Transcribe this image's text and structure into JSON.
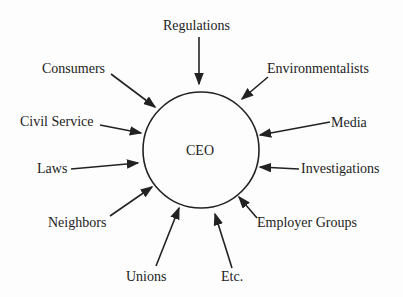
{
  "diagram": {
    "center": {
      "label": "CEO"
    },
    "influences": [
      {
        "label": "Regulations"
      },
      {
        "label": "Environmentalists"
      },
      {
        "label": "Media"
      },
      {
        "label": "Investigations"
      },
      {
        "label": "Employer Groups"
      },
      {
        "label": "Etc."
      },
      {
        "label": "Unions"
      },
      {
        "label": "Neighbors"
      },
      {
        "label": "Laws"
      },
      {
        "label": "Civil Service"
      },
      {
        "label": "Consumers"
      }
    ],
    "colors": {
      "line": "#222222",
      "background": "#fdfdfd"
    }
  }
}
